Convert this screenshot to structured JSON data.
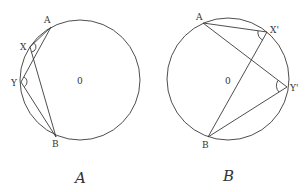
{
  "diagrams": [
    {
      "id": "A",
      "caption": "A",
      "circle": {
        "cx": 80,
        "cy": 80,
        "r": 60,
        "center_label": "0"
      },
      "points": {
        "A": {
          "x": 51,
          "y": 27,
          "label": "A"
        },
        "X": {
          "x": 30,
          "y": 47,
          "label": "X"
        },
        "Y": {
          "x": 21,
          "y": 82,
          "label": "Y"
        },
        "B": {
          "x": 56,
          "y": 137,
          "label": "B"
        }
      },
      "segments": [
        [
          "A",
          "X"
        ],
        [
          "X",
          "B"
        ],
        [
          "A",
          "Y"
        ],
        [
          "Y",
          "B"
        ],
        [
          "A",
          "B"
        ]
      ],
      "angle_marks": [
        "X",
        "Y"
      ]
    },
    {
      "id": "B",
      "caption": "B",
      "circle": {
        "cx": 228,
        "cy": 79,
        "r": 61,
        "center_label": "0"
      },
      "points": {
        "A": {
          "x": 203,
          "y": 23,
          "label": "A"
        },
        "X'": {
          "x": 267,
          "y": 32,
          "label": "X'"
        },
        "Y'": {
          "x": 287,
          "y": 87,
          "label": "Y'"
        },
        "B": {
          "x": 208,
          "y": 137,
          "label": "B"
        }
      },
      "segments": [
        [
          "A",
          "X'"
        ],
        [
          "X'",
          "B"
        ],
        [
          "A",
          "Y'"
        ],
        [
          "Y'",
          "B"
        ]
      ],
      "angle_marks": [
        "X'",
        "Y'"
      ]
    }
  ],
  "labels": {
    "a_A": "A",
    "a_X": "X",
    "a_Y": "Y",
    "a_B": "B",
    "a_O": "0",
    "a_caption": "A",
    "b_A": "A",
    "b_X": "X'",
    "b_Y": "Y'",
    "b_B": "B",
    "b_O": "0",
    "b_caption": "B"
  },
  "colors": {
    "line": "#3a3a3a",
    "background": "#ffffff"
  }
}
